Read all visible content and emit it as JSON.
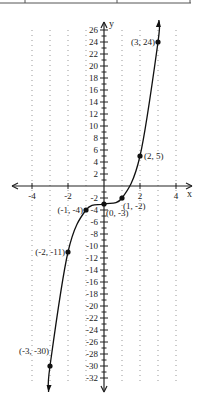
{
  "chart_data": {
    "type": "line",
    "title": "",
    "xlabel": "x",
    "ylabel": "y",
    "xlim": [
      -4.5,
      4.5
    ],
    "ylim": [
      -33,
      27
    ],
    "grid": "dotted vertical lines at each integer x",
    "x_ticks": [
      -4,
      -2,
      2,
      4
    ],
    "y_ticks": [
      26,
      24,
      22,
      20,
      18,
      16,
      14,
      12,
      10,
      8,
      6,
      4,
      2,
      -2,
      -4,
      -6,
      -8,
      -10,
      -12,
      -14,
      -16,
      -18,
      -20,
      -22,
      -24,
      -26,
      -28,
      -30,
      -32
    ],
    "series": [
      {
        "name": "curve",
        "x": [
          -3,
          -2,
          -1,
          0,
          1,
          2,
          3
        ],
        "y": [
          -30,
          -11,
          -4,
          -3,
          -2,
          5,
          24
        ],
        "labels": [
          "(-3, -30)",
          "(-2, -11)",
          "(-1, -4)",
          "(0, -3)",
          "(1, -2)",
          "(2, 5)",
          "(3, 24)"
        ]
      }
    ],
    "annotations": [
      "(3, 24)",
      "(2, 5)",
      "(1, -2)",
      "(0, -3)",
      "(-1, -4)",
      "(-2, -11)",
      "(-3, -30)"
    ]
  },
  "axes": {
    "x_name": "x",
    "y_name": "y"
  }
}
